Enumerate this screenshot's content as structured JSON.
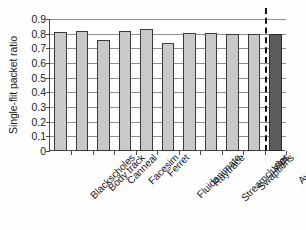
{
  "chart_data": {
    "type": "bar",
    "title": "",
    "xlabel": "",
    "ylabel": "Single-flit packet ratio",
    "ylim": [
      0,
      0.9
    ],
    "yticks": [
      "0",
      "0.1",
      "0.2",
      "0.3",
      "0.4",
      "0.5",
      "0.6",
      "0.7",
      "0.8",
      "0.9"
    ],
    "ytick_values": [
      0,
      0.1,
      0.2,
      0.3,
      0.4,
      0.5,
      0.6,
      0.7,
      0.8,
      0.9
    ],
    "grid": true,
    "legend": "none",
    "categories": [
      "Blackscholes",
      "Body track",
      "Canneal",
      "Facesim",
      "Ferret",
      "Fluidanimate",
      "Raytrace",
      "Streamcluster",
      "Swaptions",
      "Vips",
      "Average"
    ],
    "values": [
      0.81,
      0.82,
      0.76,
      0.815,
      0.835,
      0.735,
      0.805,
      0.805,
      0.8,
      0.8,
      0.8
    ],
    "series": [
      {
        "name": "Single-flit packet ratio",
        "values": [
          0.81,
          0.82,
          0.76,
          0.815,
          0.835,
          0.735,
          0.805,
          0.805,
          0.8,
          0.8,
          0.8
        ]
      }
    ],
    "bar_colors": {
      "benchmark": "#c9c9c9",
      "average": "#5c5c5c",
      "outline": "#3a3a3a"
    },
    "annotations": [
      {
        "type": "dashed-vertical-line",
        "label": "",
        "position": "between Vips and Average",
        "color": "#111111"
      }
    ]
  }
}
